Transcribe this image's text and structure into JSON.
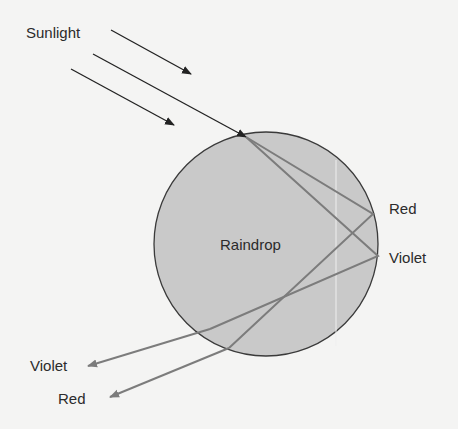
{
  "labels": {
    "sunlight": "Sunlight",
    "raindrop": "Raindrop",
    "red_right": "Red",
    "violet_right": "Violet",
    "violet_left": "Violet",
    "red_left": "Red"
  },
  "colors": {
    "background": "#f4f4f3",
    "drop_fill": "#c9c9c9",
    "drop_stroke": "#3a3a3a",
    "sun_ray": "#222222",
    "light_ray": "#7c7c7c",
    "text": "#2b2b2b"
  },
  "raindrop": {
    "cx": 266,
    "cy": 244,
    "r": 112
  }
}
